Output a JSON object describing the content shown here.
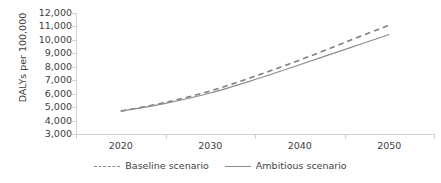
{
  "clipped_caption": "",
  "chart_data": {
    "type": "line",
    "title": "",
    "xlabel": "",
    "ylabel": "DALYs per 100,000",
    "x": [
      "2020",
      "2030",
      "2040",
      "2050"
    ],
    "categories": [
      "2020",
      "2030",
      "2040",
      "2050"
    ],
    "ylim": [
      3000,
      12000
    ],
    "ytick_values": [
      3000,
      4000,
      5000,
      6000,
      7000,
      8000,
      9000,
      10000,
      11000,
      12000
    ],
    "ytick_labels": [
      "3,000",
      "4,000",
      "5,000",
      "6,000",
      "7,000",
      "8,000",
      "9,000",
      "10,000",
      "11,000",
      "12,000"
    ],
    "xtick_labels": [
      "2020",
      "2030",
      "2040",
      "2050"
    ],
    "grid": false,
    "legend_position": "bottom",
    "series": [
      {
        "name": "Baseline scenario",
        "style": "dashed",
        "color": "#7f7f7f",
        "values": [
          4700,
          6200,
          8500,
          11100
        ],
        "points": [
          {
            "x": "2020",
            "y": 4700
          },
          {
            "x": "2025",
            "y": 5350
          },
          {
            "x": "2030",
            "y": 6200
          },
          {
            "x": "2035",
            "y": 7300
          },
          {
            "x": "2040",
            "y": 8500
          },
          {
            "x": "2045",
            "y": 9800
          },
          {
            "x": "2050",
            "y": 11100
          }
        ]
      },
      {
        "name": "Ambitious scenario",
        "style": "solid",
        "color": "#8c8c8c",
        "values": [
          4700,
          6050,
          8150,
          10400
        ],
        "points": [
          {
            "x": "2020",
            "y": 4700
          },
          {
            "x": "2025",
            "y": 5280
          },
          {
            "x": "2030",
            "y": 6050
          },
          {
            "x": "2035",
            "y": 7050
          },
          {
            "x": "2040",
            "y": 8150
          },
          {
            "x": "2045",
            "y": 9280
          },
          {
            "x": "2050",
            "y": 10400
          }
        ]
      }
    ]
  },
  "legend": {
    "items": [
      {
        "label": "Baseline scenario",
        "style": "dashed"
      },
      {
        "label": "Ambitious scenario",
        "style": "solid"
      }
    ]
  },
  "colors": {
    "axis": "#d0d0d0",
    "text": "#404040",
    "baseline_line": "#7f7f7f",
    "ambitious_line": "#8c8c8c",
    "background": "#ffffff"
  }
}
